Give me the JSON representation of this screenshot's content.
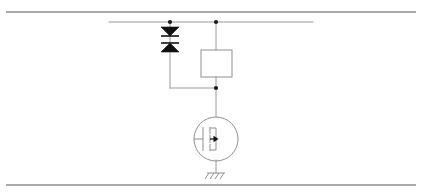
{
  "figure": {
    "background_color": "#ffffff",
    "wire_color": "#9a9a9a",
    "device_color": "#8f8f8f",
    "diode_fill": "#111111",
    "node_color": "#1a1a1a",
    "rule_color": "#8c8c8c",
    "width": 422,
    "height": 196
  },
  "frame": {
    "top_rule": {
      "name": "top-horizontal-rule",
      "y": 12,
      "x1": 6,
      "x2": 416,
      "thickness": 1.6
    },
    "bottom_rule": {
      "name": "bottom-horizontal-rule",
      "y": 185,
      "x1": 6,
      "x2": 416,
      "thickness": 1.6
    }
  },
  "circuit": {
    "supply_rail": {
      "name": "supply-rail",
      "y": 22,
      "x1": 109,
      "x2": 313
    },
    "nodes": [
      {
        "name": "clamp-top-node",
        "x": 170,
        "y": 22,
        "r": 2.1
      },
      {
        "name": "rail-branch-node",
        "x": 216,
        "y": 22,
        "r": 2.1
      },
      {
        "name": "gate-drive-node",
        "x": 216,
        "y": 88,
        "r": 2.1
      }
    ],
    "diodes": [
      {
        "name": "upper-clamp-diode",
        "orientation": "cathode-down",
        "apex_y": 36,
        "base_y": 27,
        "half_width": 9,
        "bar_y": 36,
        "x": 170
      },
      {
        "name": "lower-clamp-diode",
        "orientation": "anode-up",
        "apex_y": 43,
        "base_y": 52,
        "half_width": 9,
        "bar_y": 43,
        "x": 170
      }
    ],
    "wires": [
      {
        "name": "clamp-upper-lead",
        "x1": 170,
        "y1": 22,
        "x2": 170,
        "y2": 27
      },
      {
        "name": "clamp-interconnect",
        "x1": 170,
        "y1": 36,
        "x2": 170,
        "y2": 43
      },
      {
        "name": "clamp-lower-lead",
        "x1": 170,
        "y1": 52,
        "x2": 170,
        "y2": 88
      },
      {
        "name": "gate-horizontal-wire",
        "x1": 170,
        "y1": 88,
        "x2": 216,
        "y2": 88
      },
      {
        "name": "rail-to-resistor-wire",
        "x1": 216,
        "y1": 22,
        "x2": 216,
        "y2": 50
      },
      {
        "name": "resistor-to-node-wire",
        "x1": 216,
        "y1": 77,
        "x2": 216,
        "y2": 88
      },
      {
        "name": "node-to-transistor-wire",
        "x1": 216,
        "y1": 88,
        "x2": 216,
        "y2": 117
      },
      {
        "name": "source-to-ground-wire",
        "x1": 216,
        "y1": 160,
        "x2": 216,
        "y2": 173
      }
    ],
    "resistor": {
      "name": "resistor-box",
      "x": 201,
      "y": 50,
      "width": 31,
      "height": 27
    },
    "transistor": {
      "name": "n-channel-mosfet",
      "type": "N-channel MOSFET",
      "center_x": 216,
      "center_y": 139,
      "radius": 22,
      "gate_bar_x": 203,
      "gate_bar_y1": 127,
      "gate_bar_y2": 151,
      "channel_bar_x": 210,
      "channel_segments": [
        {
          "y1": 127,
          "y2": 134
        },
        {
          "y1": 135,
          "y2": 143
        },
        {
          "y1": 144,
          "y2": 151
        }
      ],
      "drain_stub_y": 128,
      "source_stub_y": 150,
      "body_arrow": {
        "x": 211,
        "y": 139,
        "direction": "right",
        "length": 7
      },
      "gate_lead": {
        "x1": 194,
        "y1": 139,
        "x2": 203,
        "y2": 139
      }
    },
    "ground": {
      "name": "chassis-ground-symbol",
      "x": 216,
      "y": 173,
      "bar_half_width": 9,
      "hatch_count": 4,
      "hatch_length": 7
    }
  }
}
